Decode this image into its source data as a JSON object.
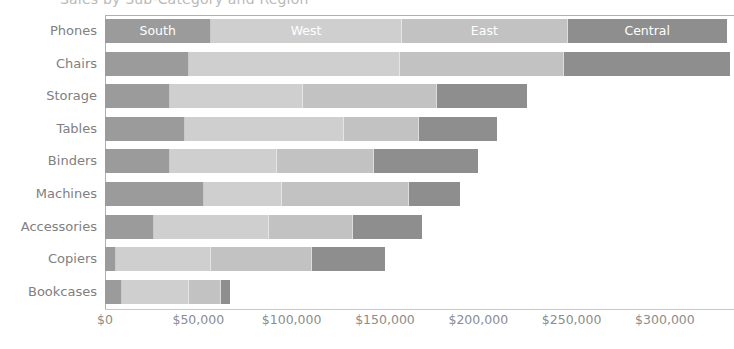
{
  "chart_data": {
    "type": "bar",
    "orientation": "horizontal",
    "stacked": true,
    "title": "Sales by Sub-Category and Region",
    "xlabel": "",
    "ylabel": "",
    "xlim": [
      0,
      337000
    ],
    "grid": false,
    "legend_position": "in-bar-labels-first-row",
    "categories": [
      "Phones",
      "Chairs",
      "Storage",
      "Tables",
      "Binders",
      "Machines",
      "Accessories",
      "Copiers",
      "Bookcases"
    ],
    "series": [
      {
        "name": "South",
        "color": "#9b9b9b",
        "values": [
          57000,
          45000,
          35000,
          43000,
          35000,
          53000,
          26000,
          6000,
          9000
        ]
      },
      {
        "name": "West",
        "color": "#cfcfcf",
        "values": [
          102000,
          113000,
          71000,
          85000,
          57000,
          42000,
          62000,
          51000,
          36000
        ]
      },
      {
        "name": "East",
        "color": "#c2c2c2",
        "values": [
          89000,
          88000,
          72000,
          40000,
          52000,
          68000,
          45000,
          54000,
          17000
        ]
      },
      {
        "name": "Central",
        "color": "#8e8e8e",
        "values": [
          85000,
          89000,
          48000,
          42000,
          56000,
          27000,
          37000,
          39000,
          5000
        ]
      }
    ],
    "totals": [
      333000,
      335000,
      226000,
      210000,
      200000,
      190000,
      170000,
      150000,
      67000
    ],
    "xticks": [
      {
        "value": 0,
        "label": "$0"
      },
      {
        "value": 50000,
        "label": "$50,000"
      },
      {
        "value": 100000,
        "label": "$100,000"
      },
      {
        "value": 150000,
        "label": "$150,000"
      },
      {
        "value": 200000,
        "label": "$200,000"
      },
      {
        "value": 250000,
        "label": "$250,000"
      },
      {
        "value": 300000,
        "label": "$300,000"
      }
    ],
    "segment_labels_row": 0,
    "segment_labels": [
      "South",
      "West",
      "East",
      "Central"
    ]
  }
}
